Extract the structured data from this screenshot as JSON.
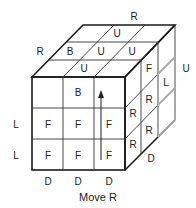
{
  "caption": "Move R",
  "outer_labels": {
    "top_back": "R",
    "top_left": "R",
    "right_side": "U",
    "left_row2": "L",
    "left_row3": "L",
    "bottom_col1": "D",
    "bottom_col2": "D",
    "bottom_col3": "D",
    "right_bottom": "D"
  },
  "front_face": [
    [
      "",
      "B",
      ""
    ],
    [
      "F",
      "F",
      "F"
    ],
    [
      "F",
      "F",
      "F"
    ]
  ],
  "top_face": [
    [
      "",
      "U",
      ""
    ],
    [
      "B",
      "U",
      "U"
    ],
    [
      "",
      "U",
      ""
    ]
  ],
  "right_face": [
    [
      "F",
      "L"
    ],
    [
      "R",
      "R"
    ],
    [
      "R",
      ""
    ]
  ],
  "colors": {
    "line": "#1a1a1a",
    "rotated_slice": "#a8a8a8",
    "background": "#ffffff"
  },
  "arrow": "up"
}
